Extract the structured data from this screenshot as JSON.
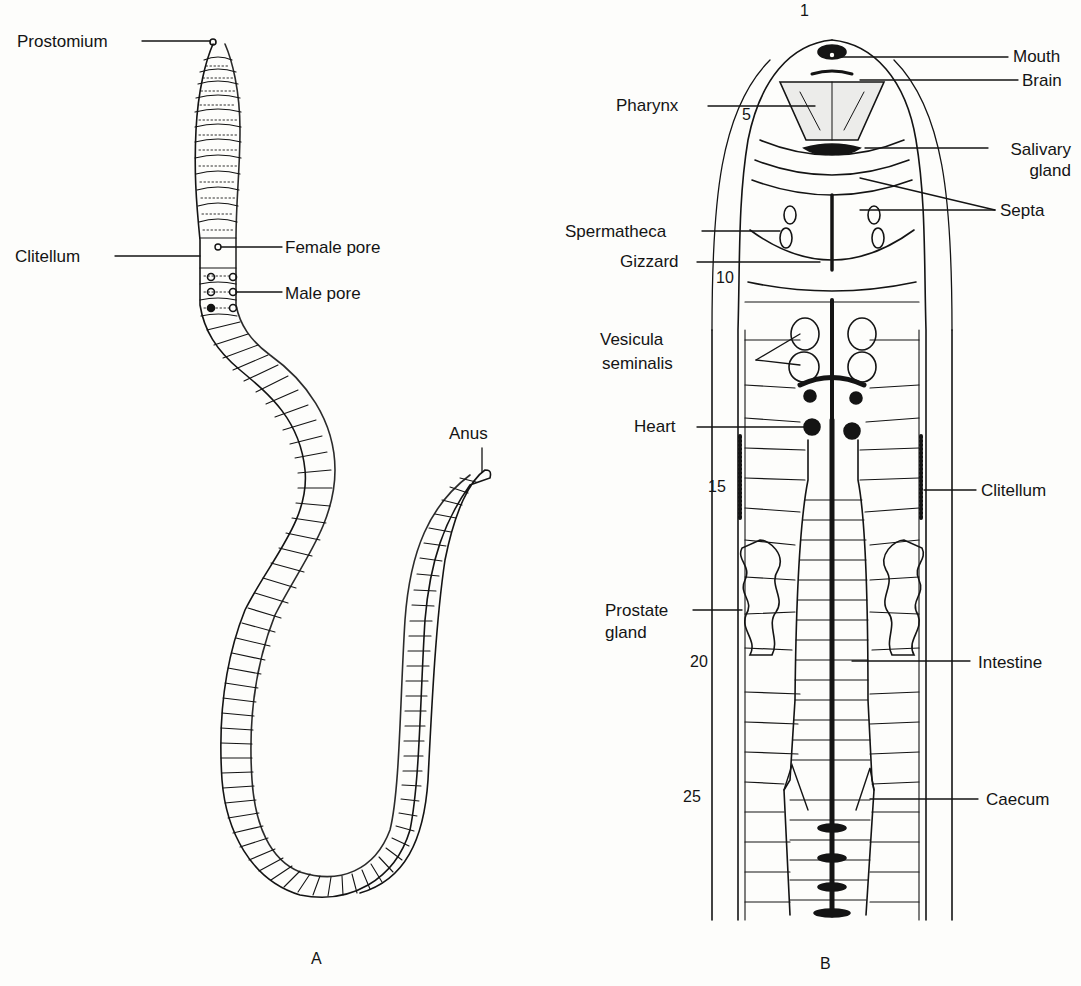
{
  "figure_a": {
    "caption": "A",
    "labels": {
      "prostomium": "Prostomium",
      "clitellum": "Clitellum",
      "female_pore": "Female pore",
      "male_pore": "Male pore",
      "anus": "Anus"
    }
  },
  "figure_b": {
    "caption": "B",
    "segment_numbers": [
      "1",
      "5",
      "10",
      "15",
      "20",
      "25"
    ],
    "labels": {
      "mouth": "Mouth",
      "brain": "Brain",
      "pharynx": "Pharynx",
      "salivary_gland_1": "Salivary",
      "salivary_gland_2": "gland",
      "septa": "Septa",
      "spermatheca": "Spermatheca",
      "gizzard": "Gizzard",
      "vesicula_1": "Vesicula",
      "vesicula_2": "seminalis",
      "heart": "Heart",
      "clitellum": "Clitellum",
      "prostate_1": "Prostate",
      "prostate_2": "gland",
      "intestine": "Intestine",
      "caecum": "Caecum"
    }
  }
}
